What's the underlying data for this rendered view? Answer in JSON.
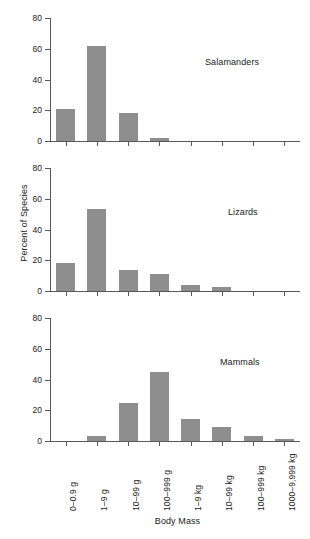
{
  "chart_data": {
    "type": "bar",
    "title": "",
    "xlabel": "Body Mass",
    "ylabel": "Percent of Species",
    "ylim": [
      0,
      80
    ],
    "yticks": [
      0,
      20,
      40,
      60,
      80
    ],
    "grid": false,
    "legend_position": "none",
    "categories": [
      "0–0.9 g",
      "1–9 g",
      "10–99 g",
      "100–999 g",
      "1–9 kg",
      "10–99 kg",
      "100–999 kg",
      "1000–9,999 kg"
    ],
    "panels": [
      {
        "name": "Salamanders",
        "annotation": "Salamanders",
        "values": [
          20.5,
          61.5,
          18.0,
          2.0,
          0,
          0,
          0,
          0
        ]
      },
      {
        "name": "Lizards",
        "annotation": "Lizards",
        "values": [
          18.5,
          53.5,
          13.5,
          11.0,
          4.0,
          2.5,
          0,
          0
        ]
      },
      {
        "name": "Mammals",
        "annotation": "Mammals",
        "values": [
          0,
          3.0,
          25.0,
          45.0,
          14.0,
          9.0,
          3.0,
          1.0
        ]
      }
    ],
    "colors": {
      "bar": "#8e8e8e",
      "axis": "#55585a",
      "text": "#1a1a1a",
      "background": "#ffffff"
    }
  }
}
